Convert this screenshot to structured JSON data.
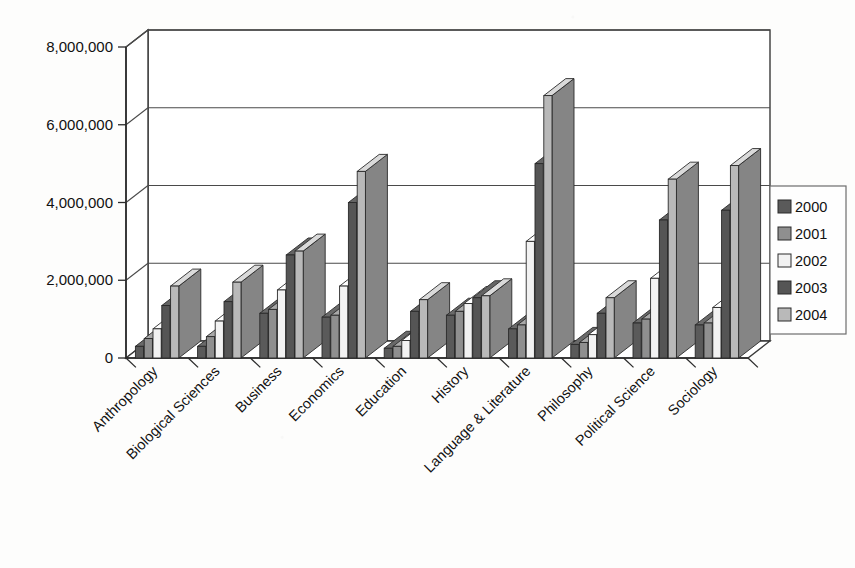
{
  "chart_data": {
    "type": "bar",
    "title": "",
    "subtitle": "",
    "xlabel": "",
    "ylabel": "",
    "style": "3d-clustered-column",
    "grid": true,
    "legend_position": "right",
    "ylim": [
      0,
      8000000
    ],
    "ytick_values": [
      0,
      2000000,
      4000000,
      6000000,
      8000000
    ],
    "ytick_labels": [
      "0",
      "2,000,000",
      "4,000,000",
      "6,000,000",
      "8,000,000"
    ],
    "categories": [
      "Anthropology",
      "Biological Sciences",
      "Business",
      "Economics",
      "Education",
      "History",
      "Language & Literature",
      "Philosophy",
      "Political Science",
      "Sociology"
    ],
    "series": [
      {
        "name": "2000",
        "color": "#5a5a5a",
        "values": [
          300000,
          300000,
          1150000,
          1050000,
          250000,
          1100000,
          750000,
          350000,
          900000,
          850000
        ]
      },
      {
        "name": "2001",
        "color": "#8f8f8f",
        "values": [
          500000,
          550000,
          1250000,
          1100000,
          300000,
          1200000,
          850000,
          400000,
          1000000,
          900000
        ]
      },
      {
        "name": "2002",
        "color": "#f2f2f2",
        "values": [
          750000,
          950000,
          1750000,
          1850000,
          450000,
          1400000,
          3000000,
          600000,
          2050000,
          1300000
        ]
      },
      {
        "name": "2003",
        "color": "#555555",
        "values": [
          1350000,
          1450000,
          2650000,
          4000000,
          1200000,
          1550000,
          5000000,
          1150000,
          3550000,
          3800000
        ]
      },
      {
        "name": "2004",
        "color": "#b9b9b9",
        "values": [
          1850000,
          1950000,
          2750000,
          4800000,
          1500000,
          1600000,
          6750000,
          1550000,
          4600000,
          4950000
        ]
      }
    ]
  },
  "legend": {
    "entries": [
      "2000",
      "2001",
      "2002",
      "2003",
      "2004"
    ]
  }
}
